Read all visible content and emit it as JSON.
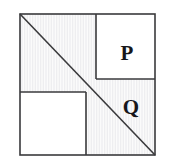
{
  "figure": {
    "type": "geometry-diagram",
    "canvas": {
      "width": 170,
      "height": 168,
      "background": "#ffffff"
    },
    "colors": {
      "stroke": "#3a3a3c",
      "label": "#17161a",
      "shaded_fill": "#fafafa",
      "hatch_line": "#e8e8ea",
      "plain_fill": "#ffffff"
    },
    "square": {
      "name": "outer-square",
      "left": 20,
      "top": 14,
      "right": 155,
      "bottom": 155,
      "stroke_width": 1.6
    },
    "lines": [
      {
        "name": "main-diagonal",
        "from": [
          20,
          14
        ],
        "to": [
          155,
          155
        ],
        "stroke_width": 1.6
      },
      {
        "name": "upper-vertical-divider",
        "from": [
          96,
          14
        ],
        "to": [
          96,
          79
        ],
        "stroke_width": 1.6
      },
      {
        "name": "upper-horizontal-divider",
        "from": [
          96,
          79
        ],
        "to": [
          155,
          79
        ],
        "stroke_width": 1.6
      },
      {
        "name": "lower-horizontal-divider",
        "from": [
          20,
          92
        ],
        "to": [
          86,
          92
        ],
        "stroke_width": 1.6
      },
      {
        "name": "lower-vertical-divider",
        "from": [
          86,
          92
        ],
        "to": [
          86,
          155
        ],
        "stroke_width": 1.6
      }
    ],
    "regions": [
      {
        "name": "region-p",
        "label": "P",
        "shaded": false,
        "label_x": 127,
        "label_y": 60,
        "font_size": 21,
        "bounds": {
          "left": 96,
          "top": 14,
          "right": 155,
          "bottom": 79
        }
      },
      {
        "name": "region-q",
        "label": "Q",
        "shaded": true,
        "label_x": 131,
        "label_y": 114,
        "font_size": 21,
        "bounds": {
          "left": 86,
          "top": 79,
          "right": 155,
          "bottom": 155
        }
      },
      {
        "name": "region-upper-left-shaded",
        "label": "",
        "shaded": true,
        "bounds": {
          "left": 20,
          "top": 14,
          "right": 96,
          "bottom": 92
        }
      },
      {
        "name": "region-lower-left-plain",
        "label": "",
        "shaded": false,
        "bounds": {
          "left": 20,
          "top": 92,
          "right": 86,
          "bottom": 155
        }
      }
    ]
  }
}
